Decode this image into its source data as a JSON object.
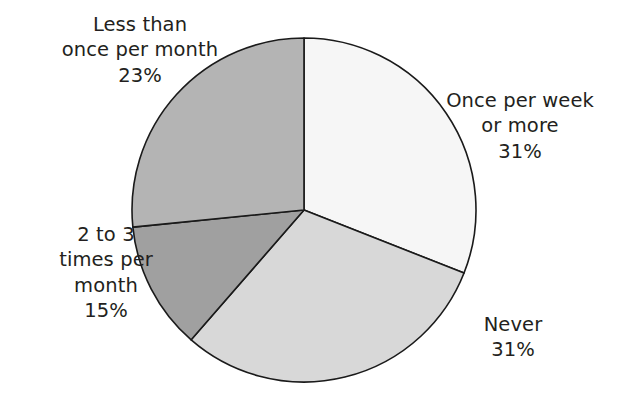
{
  "chart_data": {
    "type": "pie",
    "title": "",
    "subtitle": "",
    "xlabel": "",
    "ylabel": "",
    "legend": "none",
    "grid": false,
    "value_unit": "%",
    "start_angle_deg": 0,
    "direction": "clockwise",
    "center": {
      "x": 304,
      "y": 210
    },
    "radius": 172,
    "categories": [
      "Once per week or more",
      "Never",
      "2 to 3 times per month",
      "Less than once per month"
    ],
    "values": [
      31,
      31,
      15,
      23
    ],
    "slices": [
      {
        "id": "once-per-week",
        "label_line1": "Once per week",
        "label_line2": "or more",
        "label_percent": "31%",
        "value": 31,
        "color": "#f6f6f6",
        "start_deg": 0,
        "end_deg": 111.5
      },
      {
        "id": "never",
        "label_line1": "Never",
        "label_line2": "",
        "label_percent": "31%",
        "value": 31,
        "color": "#d8d8d8",
        "start_deg": 111.5,
        "end_deg": 221
      },
      {
        "id": "two-to-three-times",
        "label_line1": "2 to 3",
        "label_line2": "times per",
        "label_line3": "month",
        "label_percent": "15%",
        "value": 15,
        "color": "#a0a0a0",
        "start_deg": 221,
        "end_deg": 264.3
      },
      {
        "id": "less-than-once",
        "label_line1": "Less than",
        "label_line2": "once per month",
        "label_percent": "23%",
        "value": 23,
        "color": "#b4b4b4",
        "start_deg": 264.3,
        "end_deg": 360
      }
    ],
    "outline_color": "#1a1a1a",
    "background_color": "#ffffff",
    "text_color": "#231f20"
  }
}
